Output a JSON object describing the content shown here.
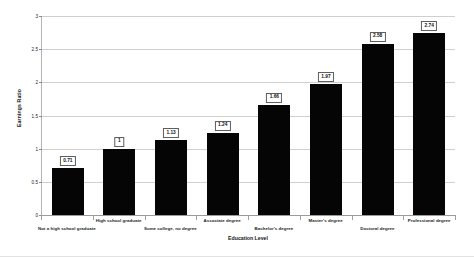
{
  "chart_data": {
    "type": "bar",
    "title": "",
    "xlabel": "Education Level",
    "ylabel": "Earnings Ratio",
    "ylim": [
      0,
      3
    ],
    "yticks": [
      "0",
      "0.5",
      "1",
      "1.5",
      "2",
      "2.5",
      "3"
    ],
    "ytick_values": [
      0,
      0.5,
      1,
      1.5,
      2,
      2.5,
      3
    ],
    "grid": true,
    "legend": "none",
    "categories": [
      "Not a high school graduate",
      "High school graduate",
      "Some college, no degree",
      "Associate degree",
      "Bachelor's degree",
      "Master's degree",
      "Doctoral degree",
      "Professional degree"
    ],
    "values": [
      0.71,
      1,
      1.13,
      1.24,
      1.66,
      1.97,
      2.58,
      2.74
    ],
    "value_labels": [
      "0.71",
      "1",
      "1.13",
      "1.24",
      "1.66",
      "1.97",
      "2.58",
      "2.74"
    ],
    "bar_color": "#050505",
    "gridline_color": "#cfcfcf",
    "axis_color": "#9a9a9a",
    "background_color": "#ffffff"
  }
}
